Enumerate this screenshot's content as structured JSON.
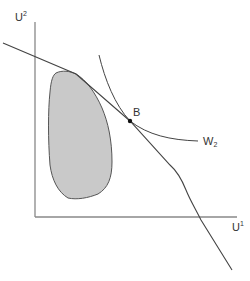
{
  "diagram": {
    "axes": {
      "y_label": {
        "base": "U",
        "sup": "2"
      },
      "x_label": {
        "base": "U",
        "sup": "1"
      }
    },
    "point": {
      "label": "B"
    },
    "curve": {
      "label": {
        "base": "W",
        "sub": "2"
      }
    },
    "colors": {
      "axis": "#777777",
      "line": "#444444",
      "region_fill": "#c8c8c8",
      "region_stroke": "#555555",
      "text": "#333333"
    }
  }
}
